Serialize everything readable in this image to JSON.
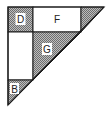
{
  "diagram": {
    "type": "geometric-dissection",
    "colors": {
      "stroke": "#1a1a1a",
      "hatch_dark": "#6e6e6e",
      "hatch_light": "#bdbdbd",
      "fill_white": "#ffffff"
    },
    "regions": [
      {
        "id": "D",
        "label": "D",
        "shape": "square",
        "fill": "hatched"
      },
      {
        "id": "F",
        "label": "F",
        "shape": "rectangle",
        "fill": "white"
      },
      {
        "id": "corner-triangle",
        "label": "",
        "shape": "triangle",
        "fill": "hatched"
      },
      {
        "id": "left-rectangle",
        "label": "",
        "shape": "rectangle",
        "fill": "white"
      },
      {
        "id": "G",
        "label": "G",
        "shape": "triangle",
        "fill": "hatched"
      },
      {
        "id": "B",
        "label": "B",
        "shape": "triangle",
        "fill": "hatched"
      }
    ],
    "labels": {
      "d": "D",
      "f": "F",
      "g": "G",
      "b": "B"
    }
  }
}
